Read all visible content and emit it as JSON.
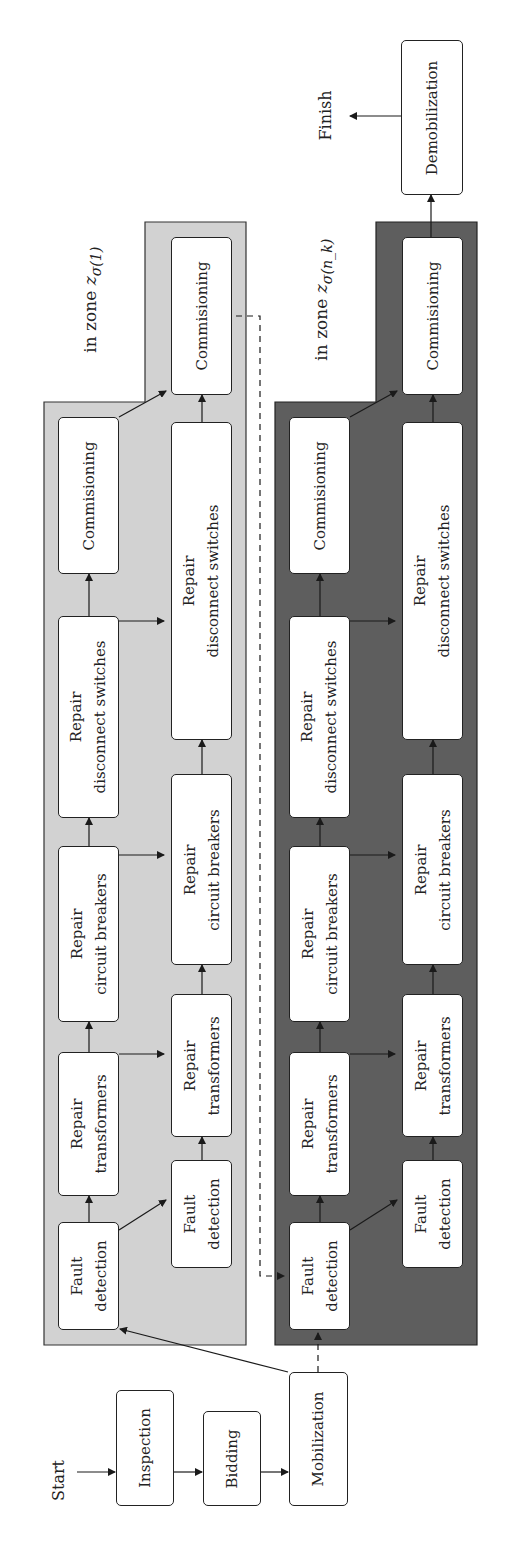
{
  "diagram": {
    "start_label": "Start",
    "finish_label": "Finish",
    "pre_steps": [
      "Inspection",
      "Bidding",
      "Mobilization"
    ],
    "post_step": "Demobilization",
    "colors": {
      "light_zone_fill": "#d2d2d2",
      "dark_zone_fill": "#5e5e5e",
      "box_fill": "#ffffff",
      "line": "#1a1a1a"
    },
    "zones": [
      {
        "label_prefix": "in zone ",
        "label_math": "z",
        "label_sub": "σ(1)",
        "shade": "light",
        "outer_column": [
          {
            "line1": "Fault",
            "line2": "detection"
          },
          {
            "line1": "Repair",
            "line2": "transformers"
          },
          {
            "line1": "Repair",
            "line2": "circuit breakers"
          },
          {
            "line1": "Repair",
            "line2": "disconnect switches"
          },
          {
            "line1": "Commisioning",
            "line2": ""
          }
        ],
        "inner_column": [
          {
            "line1": "Fault",
            "line2": "detection"
          },
          {
            "line1": "Repair",
            "line2": "transformers"
          },
          {
            "line1": "Repair",
            "line2": "circuit breakers"
          },
          {
            "line1": "Repair",
            "line2": "disconnect switches"
          },
          {
            "line1": "Commisioning",
            "line2": ""
          }
        ]
      },
      {
        "label_prefix": "in zone ",
        "label_math": "z",
        "label_sub": "σ(n_k)",
        "shade": "dark",
        "outer_column": [
          {
            "line1": "Fault",
            "line2": "detection"
          },
          {
            "line1": "Repair",
            "line2": "transformers"
          },
          {
            "line1": "Repair",
            "line2": "circuit breakers"
          },
          {
            "line1": "Repair",
            "line2": "disconnect switches"
          },
          {
            "line1": "Commisioning",
            "line2": ""
          }
        ],
        "inner_column": [
          {
            "line1": "Fault",
            "line2": "detection"
          },
          {
            "line1": "Repair",
            "line2": "transformers"
          },
          {
            "line1": "Repair",
            "line2": "circuit breakers"
          },
          {
            "line1": "Repair",
            "line2": "disconnect switches"
          },
          {
            "line1": "Commisioning",
            "line2": ""
          }
        ]
      }
    ]
  }
}
